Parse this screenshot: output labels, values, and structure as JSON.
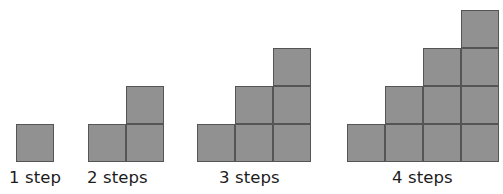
{
  "diagram": {
    "background_color": "#ffffff",
    "square": {
      "size_px": 38,
      "fill_color": "#919191",
      "border_color": "#555555",
      "border_width_px": 1
    },
    "baseline_y_px": 162,
    "label_color": "#1c1c1c",
    "figures": [
      {
        "id": "figure-1-step",
        "label": "1 step",
        "steps": 1,
        "total_squares": 1,
        "column_heights": [
          1
        ],
        "origin_x_px": 16,
        "label_x_px": 9,
        "label_y_px": 168
      },
      {
        "id": "figure-2-steps",
        "label": "2 steps",
        "steps": 2,
        "total_squares": 3,
        "column_heights": [
          1,
          2
        ],
        "origin_x_px": 88,
        "label_x_px": 87,
        "label_y_px": 168
      },
      {
        "id": "figure-3-steps",
        "label": "3 steps",
        "steps": 3,
        "total_squares": 6,
        "column_heights": [
          1,
          2,
          3
        ],
        "origin_x_px": 197,
        "label_x_px": 219,
        "label_y_px": 168
      },
      {
        "id": "figure-4-steps",
        "label": "4 steps",
        "steps": 4,
        "total_squares": 10,
        "column_heights": [
          1,
          2,
          3,
          4
        ],
        "origin_x_px": 347,
        "label_x_px": 392,
        "label_y_px": 168
      }
    ]
  }
}
